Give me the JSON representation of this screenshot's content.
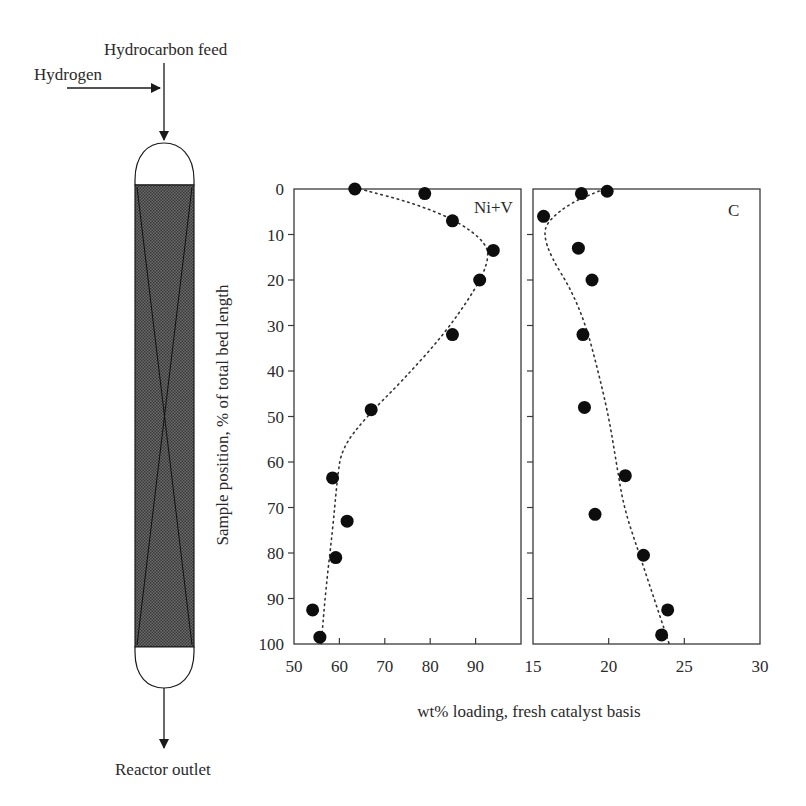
{
  "diagram": {
    "labels": {
      "hydrocarbon_feed": "Hydrocarbon feed",
      "hydrogen": "Hydrogen",
      "reactor_outlet": "Reactor outlet"
    }
  },
  "axes": {
    "ylabel": "Sample position, % of total bed length",
    "xlabel": "wt% loading, fresh catalyst basis",
    "y_ticks": [
      "0",
      "10",
      "20",
      "30",
      "40",
      "50",
      "60",
      "70",
      "80",
      "90",
      "100"
    ],
    "left_x_ticks": [
      "50",
      "60",
      "70",
      "80",
      "90"
    ],
    "right_x_ticks": [
      "15",
      "20",
      "25",
      "30"
    ]
  },
  "chart_data": [
    {
      "type": "scatter",
      "title": "Ni+V",
      "panel_label": "Ni+V",
      "xlabel": "wt% loading, fresh catalyst basis",
      "ylabel": "Sample position, % of total bed length",
      "xlim": [
        50,
        100
      ],
      "ylim": [
        100,
        0
      ],
      "x_ticks": [
        50,
        60,
        70,
        80,
        90
      ],
      "y_ticks": [
        0,
        10,
        20,
        30,
        40,
        50,
        60,
        70,
        80,
        90,
        100
      ],
      "grid": false,
      "series": [
        {
          "name": "Ni+V measured",
          "points": [
            {
              "x": 63.4,
              "y": 0
            },
            {
              "x": 78.8,
              "y": 1
            },
            {
              "x": 84.9,
              "y": 7
            },
            {
              "x": 93.9,
              "y": 13.5
            },
            {
              "x": 90.9,
              "y": 20
            },
            {
              "x": 84.9,
              "y": 32
            },
            {
              "x": 67.0,
              "y": 48.5
            },
            {
              "x": 58.5,
              "y": 63.5
            },
            {
              "x": 61.7,
              "y": 73
            },
            {
              "x": 59.2,
              "y": 81
            },
            {
              "x": 54.1,
              "y": 92.5
            },
            {
              "x": 55.7,
              "y": 98.5
            }
          ]
        },
        {
          "name": "Ni+V trend (dotted)",
          "style": "dotted",
          "points": [
            {
              "x": 64.5,
              "y": 0
            },
            {
              "x": 76,
              "y": 3
            },
            {
              "x": 86,
              "y": 7
            },
            {
              "x": 92.5,
              "y": 12
            },
            {
              "x": 92.8,
              "y": 16
            },
            {
              "x": 90,
              "y": 22
            },
            {
              "x": 83,
              "y": 32
            },
            {
              "x": 74,
              "y": 42
            },
            {
              "x": 66,
              "y": 50
            },
            {
              "x": 60.5,
              "y": 57
            },
            {
              "x": 59.5,
              "y": 64
            },
            {
              "x": 58.5,
              "y": 75
            },
            {
              "x": 57,
              "y": 88
            },
            {
              "x": 56,
              "y": 100
            }
          ]
        }
      ]
    },
    {
      "type": "scatter",
      "title": "C",
      "panel_label": "C",
      "xlabel": "wt% loading, fresh catalyst basis",
      "ylabel": "Sample position, % of total bed length",
      "xlim": [
        15,
        30
      ],
      "ylim": [
        100,
        0
      ],
      "x_ticks": [
        15,
        20,
        25,
        30
      ],
      "y_ticks": [
        0,
        10,
        20,
        30,
        40,
        50,
        60,
        70,
        80,
        90,
        100
      ],
      "grid": false,
      "series": [
        {
          "name": "C measured",
          "points": [
            {
              "x": 19.9,
              "y": 0.5
            },
            {
              "x": 18.2,
              "y": 1
            },
            {
              "x": 15.7,
              "y": 6
            },
            {
              "x": 18.0,
              "y": 13
            },
            {
              "x": 18.9,
              "y": 20
            },
            {
              "x": 18.3,
              "y": 32
            },
            {
              "x": 18.4,
              "y": 48
            },
            {
              "x": 21.1,
              "y": 63
            },
            {
              "x": 19.1,
              "y": 71.5
            },
            {
              "x": 22.3,
              "y": 80.5
            },
            {
              "x": 23.9,
              "y": 92.5
            },
            {
              "x": 23.5,
              "y": 98
            }
          ]
        },
        {
          "name": "C trend (dotted)",
          "style": "dotted",
          "points": [
            {
              "x": 19.7,
              "y": 0
            },
            {
              "x": 17.5,
              "y": 3
            },
            {
              "x": 16.0,
              "y": 7
            },
            {
              "x": 15.7,
              "y": 10
            },
            {
              "x": 16.2,
              "y": 15
            },
            {
              "x": 17.5,
              "y": 22
            },
            {
              "x": 18.5,
              "y": 30
            },
            {
              "x": 19.3,
              "y": 40
            },
            {
              "x": 20.0,
              "y": 50
            },
            {
              "x": 20.5,
              "y": 60
            },
            {
              "x": 21.0,
              "y": 70
            },
            {
              "x": 22.0,
              "y": 80
            },
            {
              "x": 23.0,
              "y": 90
            },
            {
              "x": 24.0,
              "y": 100
            }
          ]
        }
      ]
    }
  ]
}
